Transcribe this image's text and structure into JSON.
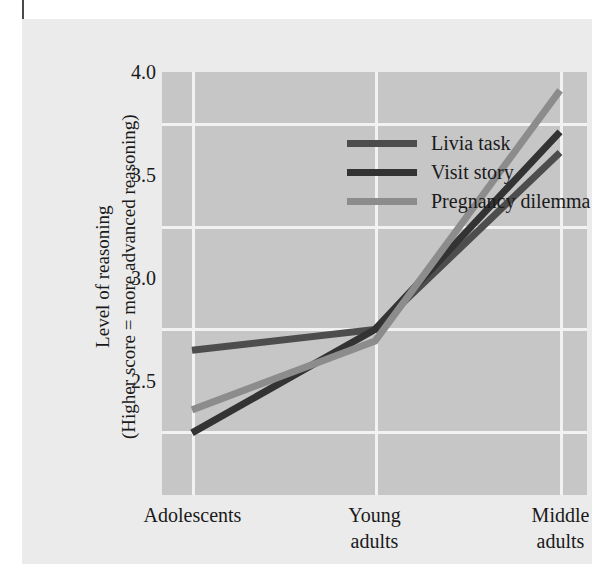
{
  "chart_data": {
    "type": "line",
    "title": "",
    "xlabel": "",
    "ylabel": "Level of reasoning (Higher score = more advanced reasoning)",
    "ylabel_line1": "Level of reasoning",
    "ylabel_line2": "(Higher score = more advanced reasoning)",
    "categories": [
      "Adolescents",
      "Young\nadults",
      "Middle\nadults"
    ],
    "x_tick_labels": [
      "Adolescents",
      "Young adults",
      "Middle adults"
    ],
    "y_tick_labels": [
      "4.0",
      "3.5",
      "3.0",
      "2.5"
    ],
    "y_tick_values": [
      4.0,
      3.5,
      3.0,
      2.5
    ],
    "ylim": [
      2.33,
      4.17
    ],
    "grid": true,
    "legend_position": "top-left inside plot",
    "series": [
      {
        "name": "Livia task",
        "color": "#4d4d4d",
        "values": [
          2.96,
          3.05,
          3.82
        ]
      },
      {
        "name": "Visit story",
        "color": "#333333",
        "values": [
          2.6,
          3.05,
          3.91
        ]
      },
      {
        "name": "Pregnancy dilemma",
        "color": "#8c8c8c",
        "values": [
          2.7,
          3.0,
          4.09
        ]
      }
    ]
  },
  "legend": {
    "items": [
      {
        "label": "Livia task",
        "swatch_color": "#4d4d4d"
      },
      {
        "label": "Visit story",
        "swatch_color": "#333333"
      },
      {
        "label": "Pregnancy dilemma",
        "swatch_color": "#8c8c8c"
      }
    ]
  },
  "axes": {
    "y_ticks": [
      "4.0",
      "3.5",
      "3.0",
      "2.5"
    ],
    "x_ticks": [
      "Adolescents",
      "Young\nadults",
      "Middle\nadults"
    ],
    "y_title_line1": "Level of reasoning",
    "y_title_line2": "(Higher score = more advanced reasoning)"
  },
  "colors": {
    "figure_background": "#ebebeb",
    "plot_background": "#c6c6c6",
    "gridline": "#f2f2f2",
    "text": "#1a1a1a"
  }
}
